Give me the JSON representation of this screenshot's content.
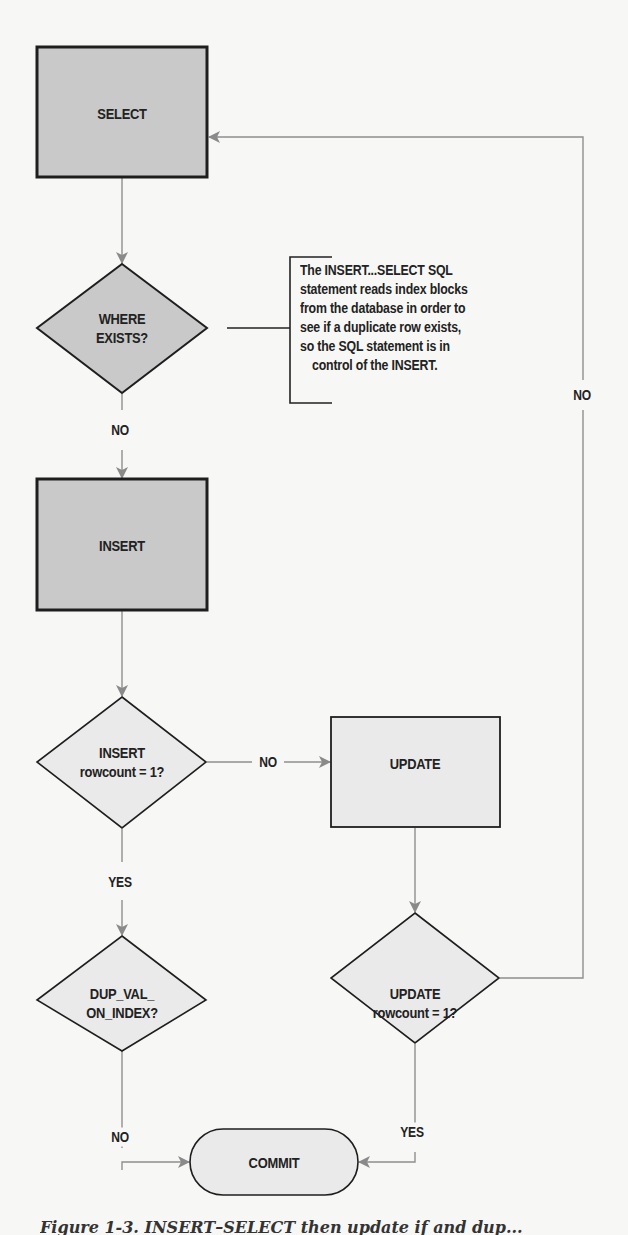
{
  "diagram": {
    "type": "flowchart",
    "nodes": {
      "select": {
        "label": "SELECT",
        "shape": "process",
        "fill": "#c9c9c9"
      },
      "where_exists": {
        "label_line1": "WHERE",
        "label_line2": "EXISTS?",
        "shape": "decision",
        "fill": "#c9c9c9"
      },
      "insert": {
        "label": "INSERT",
        "shape": "process",
        "fill": "#c9c9c9"
      },
      "insert_rowcount": {
        "label_line1": "INSERT",
        "label_line2": "rowcount = 1?",
        "shape": "decision",
        "fill": "#eaeaea"
      },
      "update": {
        "label": "UPDATE",
        "shape": "process",
        "fill": "#eaeaea"
      },
      "dup_val": {
        "label_line1": "DUP_VAL_",
        "label_line2": "ON_INDEX?",
        "shape": "decision",
        "fill": "#eaeaea"
      },
      "update_rowcount": {
        "label_line1": "UPDATE",
        "label_line2": "rowcount = 1?",
        "shape": "decision",
        "fill": "#eaeaea"
      },
      "commit": {
        "label": "COMMIT",
        "shape": "terminator",
        "fill": "#eaeaea"
      }
    },
    "edges": {
      "where_to_insert": {
        "label": "NO"
      },
      "insert_rowcount_to_update": {
        "label": "NO"
      },
      "insert_rowcount_to_dup": {
        "label": "YES"
      },
      "dup_to_commit": {
        "label": "NO"
      },
      "update_rowcount_to_commit": {
        "label": "YES"
      },
      "update_rowcount_to_select": {
        "label": "NO"
      }
    },
    "annotation": {
      "lines": [
        "The INSERT...SELECT SQL",
        "statement reads index blocks",
        "from the database in order to",
        "see if a duplicate row exists,",
        "so the SQL statement is in",
        "control of the INSERT."
      ]
    },
    "colors": {
      "line": "#8a8a8a",
      "border": "#1e1e1e",
      "arrow": "#8a8a8a"
    }
  },
  "caption": "Figure 1-3. INSERT–SELECT then update if and dup..."
}
